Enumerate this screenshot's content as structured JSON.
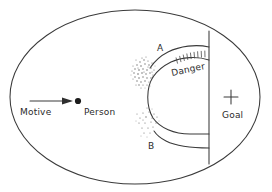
{
  "figure": {
    "title": "",
    "background_color": "#ffffff",
    "line_color": "#3a3a3a",
    "text_color": "#2b2b2b",
    "stipple_color": "#6d6d6d",
    "labels": {
      "motive": "Motive",
      "person": "Person",
      "goal": "Goal",
      "danger": "Danger",
      "region_a": "A",
      "region_b": "B"
    },
    "icons": {
      "goal_marker": "plus-cross-icon",
      "person_marker": "filled-dot-icon",
      "motive_vector": "right-arrow-icon",
      "hazard_band": "hatched-band-icon",
      "field_boundary": "ellipse-boundary-icon",
      "barrier": "vertical-barrier-icon",
      "upper_channel": "upper-arc-icon",
      "lower_channel": "lower-arc-icon",
      "stipple_a": "dense-stipple-cloud-icon",
      "stipple_b": "sparse-stipple-cloud-icon"
    },
    "geometry": {
      "ellipse_center_x": 135,
      "ellipse_center_y": 97,
      "ellipse_radius_x": 126,
      "ellipse_radius_y": 88,
      "barrier_x": 209,
      "barrier_top_y": 31,
      "barrier_bottom_y": 164,
      "person_dot_x": 76,
      "person_dot_y": 101,
      "arrow_start_x": 30,
      "arrow_end_x": 72,
      "arrow_y": 101,
      "goal_cross_x": 231,
      "goal_cross_y": 103
    }
  }
}
